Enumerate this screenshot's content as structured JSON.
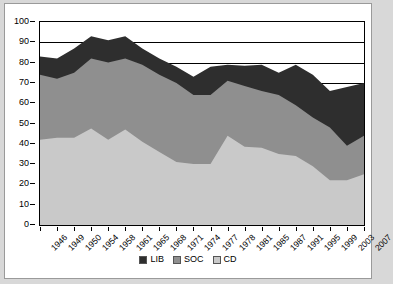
{
  "chart_data": {
    "type": "area",
    "stacked": true,
    "title": "",
    "xlabel": "",
    "ylabel": "",
    "ylim": [
      0,
      100
    ],
    "ytick_step": 10,
    "yticks": [
      100,
      90,
      80,
      70,
      60,
      50,
      40,
      30,
      20,
      10,
      0
    ],
    "grid": true,
    "legend_position": "bottom",
    "categories": [
      "1946",
      "1949",
      "1950",
      "1954",
      "1958",
      "1961",
      "1965",
      "1968",
      "1971",
      "1974",
      "1977",
      "1978",
      "1981",
      "1985",
      "1987",
      "1991",
      "1995",
      "1999",
      "2003",
      "2007"
    ],
    "series": [
      {
        "name": "CD",
        "color": "#c9c9c9",
        "values": [
          42,
          43,
          43,
          47.5,
          42,
          47,
          41,
          36,
          31,
          30,
          30,
          44,
          38.5,
          38,
          35,
          34,
          29,
          22,
          22,
          25
        ]
      },
      {
        "name": "SOC",
        "color": "#8f8f8f",
        "values": [
          32,
          29,
          32,
          34.5,
          38,
          35,
          38,
          38,
          39,
          34,
          34,
          27,
          30,
          28,
          29,
          25,
          24,
          26,
          17,
          19
        ]
      },
      {
        "name": "LIB",
        "color": "#2e2e2e",
        "values": [
          9,
          10,
          12,
          11,
          11,
          11,
          8,
          8,
          8,
          9,
          14,
          8,
          10,
          13,
          11,
          20,
          21,
          18,
          29,
          26
        ]
      }
    ],
    "totals": [
      83,
      82,
      87,
      93,
      91,
      93,
      87,
      82,
      78,
      73,
      78,
      79,
      78.5,
      79,
      75,
      79,
      74,
      66,
      68,
      70
    ]
  },
  "legend": {
    "entries": [
      {
        "label": "LIB",
        "color": "#2e2e2e"
      },
      {
        "label": "SOC",
        "color": "#8f8f8f"
      },
      {
        "label": "CD",
        "color": "#c9c9c9"
      }
    ]
  }
}
